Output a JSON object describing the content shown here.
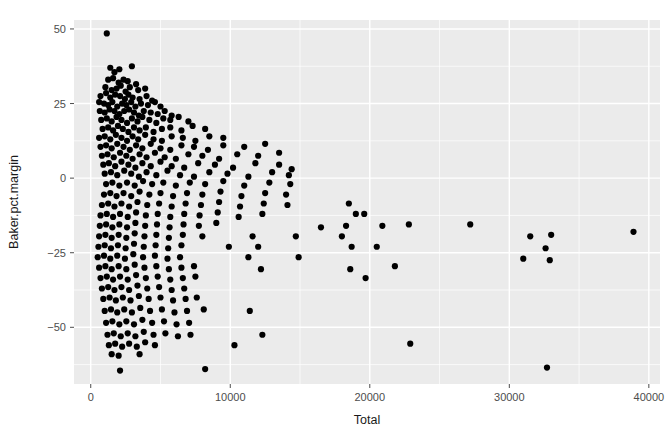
{
  "figure": {
    "kind": "scatter-plot",
    "background_color": "#FFFFFF",
    "panel_color": "#EBEBEB",
    "gridline_color": "#FFFFFF",
    "point_color": "#000000",
    "tick_label_color": "#4D4D4D",
    "axis_title_color": "#1A1A1A"
  },
  "chart_data": {
    "type": "scatter",
    "title": "",
    "xlabel": "Total",
    "ylabel": "Baker.pct.margin",
    "xlim": [
      -1200,
      40800
    ],
    "ylim": [
      -69,
      53
    ],
    "xticks": [
      0,
      10000,
      20000,
      30000,
      40000
    ],
    "xtick_labels": [
      "0",
      "10000",
      "20000",
      "30000",
      "40000"
    ],
    "yticks": [
      -50,
      -25,
      0,
      25,
      50
    ],
    "ytick_labels": [
      "-50",
      "-25",
      "0",
      "25",
      "50"
    ],
    "grid": true,
    "minor_grid": true,
    "legend": "none",
    "point_color": "#000000",
    "point_size": 3.1,
    "n_points": 306,
    "points": [
      [
        1150,
        48.5
      ],
      [
        1400,
        37.0
      ],
      [
        1700,
        35.5
      ],
      [
        2050,
        36.5
      ],
      [
        2950,
        37.5
      ],
      [
        1250,
        33.0
      ],
      [
        1600,
        33.5
      ],
      [
        2000,
        32.0
      ],
      [
        2350,
        33.0
      ],
      [
        2650,
        32.5
      ],
      [
        3250,
        31.5
      ],
      [
        1050,
        30.5
      ],
      [
        1500,
        29.5
      ],
      [
        1850,
        30.0
      ],
      [
        2150,
        31.0
      ],
      [
        2500,
        29.0
      ],
      [
        2800,
        30.5
      ],
      [
        3400,
        29.5
      ],
      [
        3900,
        30.0
      ],
      [
        700,
        27.5
      ],
      [
        1100,
        28.5
      ],
      [
        1400,
        27.0
      ],
      [
        1750,
        28.0
      ],
      [
        2100,
        27.5
      ],
      [
        2450,
        26.5
      ],
      [
        2700,
        28.0
      ],
      [
        3000,
        27.0
      ],
      [
        3500,
        26.5
      ],
      [
        4000,
        27.5
      ],
      [
        4400,
        26.0
      ],
      [
        600,
        25.5
      ],
      [
        950,
        25.0
      ],
      [
        1250,
        24.5
      ],
      [
        1550,
        25.5
      ],
      [
        1900,
        24.0
      ],
      [
        2250,
        25.0
      ],
      [
        2550,
        24.5
      ],
      [
        2900,
        25.5
      ],
      [
        3200,
        24.0
      ],
      [
        3600,
        25.0
      ],
      [
        4100,
        24.5
      ],
      [
        4600,
        25.5
      ],
      [
        5000,
        24.0
      ],
      [
        650,
        22.5
      ],
      [
        1000,
        22.0
      ],
      [
        1350,
        23.0
      ],
      [
        1700,
        22.5
      ],
      [
        2050,
        21.5
      ],
      [
        2400,
        22.5
      ],
      [
        2750,
        23.0
      ],
      [
        3100,
        22.0
      ],
      [
        3450,
        21.0
      ],
      [
        3800,
        22.5
      ],
      [
        4300,
        22.0
      ],
      [
        4800,
        21.5
      ],
      [
        5300,
        22.5
      ],
      [
        5800,
        21.0
      ],
      [
        750,
        19.5
      ],
      [
        1150,
        20.0
      ],
      [
        1500,
        19.0
      ],
      [
        1850,
        20.5
      ],
      [
        2200,
        19.5
      ],
      [
        2600,
        18.5
      ],
      [
        2950,
        20.0
      ],
      [
        3350,
        19.0
      ],
      [
        3700,
        20.5
      ],
      [
        4200,
        19.5
      ],
      [
        4700,
        18.5
      ],
      [
        5200,
        20.0
      ],
      [
        5700,
        19.5
      ],
      [
        6300,
        20.5
      ],
      [
        7000,
        19.0
      ],
      [
        850,
        16.5
      ],
      [
        1250,
        17.0
      ],
      [
        1600,
        16.0
      ],
      [
        1950,
        17.5
      ],
      [
        2300,
        16.5
      ],
      [
        2700,
        15.5
      ],
      [
        3100,
        17.0
      ],
      [
        3500,
        16.0
      ],
      [
        3950,
        17.0
      ],
      [
        4500,
        15.5
      ],
      [
        5100,
        16.5
      ],
      [
        5700,
        17.0
      ],
      [
        6500,
        16.0
      ],
      [
        7300,
        17.5
      ],
      [
        8200,
        16.5
      ],
      [
        600,
        13.5
      ],
      [
        1000,
        14.0
      ],
      [
        1400,
        13.0
      ],
      [
        1800,
        14.5
      ],
      [
        2200,
        13.5
      ],
      [
        2600,
        12.5
      ],
      [
        3000,
        14.0
      ],
      [
        3400,
        13.0
      ],
      [
        3900,
        14.5
      ],
      [
        4500,
        13.0
      ],
      [
        5100,
        12.5
      ],
      [
        5800,
        14.0
      ],
      [
        6600,
        13.5
      ],
      [
        7500,
        12.5
      ],
      [
        8500,
        14.0
      ],
      [
        9500,
        13.5
      ],
      [
        700,
        10.5
      ],
      [
        1100,
        11.0
      ],
      [
        1500,
        10.0
      ],
      [
        1900,
        11.5
      ],
      [
        2350,
        10.5
      ],
      [
        2800,
        9.5
      ],
      [
        3250,
        11.0
      ],
      [
        3700,
        10.0
      ],
      [
        4300,
        11.5
      ],
      [
        5000,
        10.0
      ],
      [
        5700,
        9.5
      ],
      [
        6500,
        11.0
      ],
      [
        7400,
        10.5
      ],
      [
        8400,
        9.5
      ],
      [
        9500,
        11.0
      ],
      [
        11000,
        10.5
      ],
      [
        12500,
        11.5
      ],
      [
        800,
        7.5
      ],
      [
        1200,
        8.0
      ],
      [
        1650,
        7.0
      ],
      [
        2100,
        8.5
      ],
      [
        2550,
        7.5
      ],
      [
        3000,
        6.5
      ],
      [
        3500,
        8.0
      ],
      [
        4000,
        7.0
      ],
      [
        4600,
        8.5
      ],
      [
        5300,
        7.0
      ],
      [
        6100,
        6.5
      ],
      [
        7000,
        8.0
      ],
      [
        8000,
        7.5
      ],
      [
        9200,
        6.5
      ],
      [
        10500,
        8.0
      ],
      [
        12000,
        7.5
      ],
      [
        13500,
        8.5
      ],
      [
        900,
        4.5
      ],
      [
        1300,
        5.0
      ],
      [
        1750,
        4.0
      ],
      [
        2200,
        5.5
      ],
      [
        2700,
        4.5
      ],
      [
        3200,
        3.5
      ],
      [
        3700,
        5.0
      ],
      [
        4300,
        4.0
      ],
      [
        5000,
        5.5
      ],
      [
        5800,
        4.0
      ],
      [
        6700,
        3.5
      ],
      [
        7700,
        5.0
      ],
      [
        8900,
        4.5
      ],
      [
        10200,
        3.5
      ],
      [
        11800,
        5.0
      ],
      [
        13500,
        4.5
      ],
      [
        14400,
        3.0
      ],
      [
        1000,
        1.5
      ],
      [
        1450,
        2.0
      ],
      [
        1900,
        1.0
      ],
      [
        2400,
        2.5
      ],
      [
        2900,
        1.5
      ],
      [
        3450,
        0.5
      ],
      [
        4000,
        2.0
      ],
      [
        4700,
        1.0
      ],
      [
        5500,
        2.5
      ],
      [
        6400,
        1.0
      ],
      [
        7400,
        0.5
      ],
      [
        8500,
        2.0
      ],
      [
        9800,
        1.5
      ],
      [
        11300,
        0.5
      ],
      [
        13000,
        2.0
      ],
      [
        14200,
        1.0
      ],
      [
        1100,
        -2.0
      ],
      [
        1550,
        -1.5
      ],
      [
        2050,
        -2.5
      ],
      [
        2600,
        -1.5
      ],
      [
        3150,
        -2.5
      ],
      [
        3750,
        -1.0
      ],
      [
        4400,
        -2.0
      ],
      [
        5200,
        -1.5
      ],
      [
        6100,
        -2.5
      ],
      [
        7100,
        -1.5
      ],
      [
        8200,
        -2.0
      ],
      [
        9500,
        -1.0
      ],
      [
        11000,
        -2.5
      ],
      [
        12800,
        -1.5
      ],
      [
        14300,
        -2.0
      ],
      [
        950,
        -5.5
      ],
      [
        1400,
        -5.0
      ],
      [
        1850,
        -6.0
      ],
      [
        2350,
        -5.0
      ],
      [
        2900,
        -6.0
      ],
      [
        3500,
        -4.5
      ],
      [
        4200,
        -5.5
      ],
      [
        5000,
        -5.0
      ],
      [
        5900,
        -6.0
      ],
      [
        6900,
        -5.0
      ],
      [
        8000,
        -5.5
      ],
      [
        9300,
        -4.5
      ],
      [
        10800,
        -6.0
      ],
      [
        12500,
        -5.0
      ],
      [
        14000,
        -5.5
      ],
      [
        800,
        -9.0
      ],
      [
        1250,
        -8.5
      ],
      [
        1700,
        -9.5
      ],
      [
        2200,
        -8.5
      ],
      [
        2750,
        -9.5
      ],
      [
        3350,
        -8.0
      ],
      [
        4050,
        -9.0
      ],
      [
        4900,
        -8.5
      ],
      [
        5800,
        -9.5
      ],
      [
        6800,
        -8.5
      ],
      [
        7900,
        -9.0
      ],
      [
        9200,
        -8.0
      ],
      [
        10700,
        -9.5
      ],
      [
        12400,
        -8.5
      ],
      [
        14100,
        -9.0
      ],
      [
        18500,
        -8.5
      ],
      [
        700,
        -12.5
      ],
      [
        1150,
        -12.0
      ],
      [
        1600,
        -13.0
      ],
      [
        2100,
        -12.0
      ],
      [
        2650,
        -13.0
      ],
      [
        3250,
        -11.5
      ],
      [
        3950,
        -12.5
      ],
      [
        4800,
        -12.0
      ],
      [
        5700,
        -13.0
      ],
      [
        6700,
        -12.0
      ],
      [
        7800,
        -12.5
      ],
      [
        9100,
        -11.5
      ],
      [
        10600,
        -13.0
      ],
      [
        12300,
        -12.0
      ],
      [
        19000,
        -12.0
      ],
      [
        19600,
        -12.0
      ],
      [
        650,
        -16.0
      ],
      [
        1100,
        -15.5
      ],
      [
        1550,
        -16.5
      ],
      [
        2050,
        -15.5
      ],
      [
        2600,
        -16.5
      ],
      [
        3200,
        -15.0
      ],
      [
        3900,
        -16.0
      ],
      [
        4750,
        -15.5
      ],
      [
        5650,
        -16.5
      ],
      [
        6650,
        -15.5
      ],
      [
        7750,
        -16.0
      ],
      [
        9000,
        -15.0
      ],
      [
        16500,
        -16.5
      ],
      [
        18300,
        -16.0
      ],
      [
        20900,
        -16.0
      ],
      [
        22800,
        -15.5
      ],
      [
        27200,
        -15.5
      ],
      [
        600,
        -19.5
      ],
      [
        1050,
        -19.0
      ],
      [
        1500,
        -20.0
      ],
      [
        2000,
        -19.0
      ],
      [
        2550,
        -20.0
      ],
      [
        3150,
        -18.5
      ],
      [
        3850,
        -19.5
      ],
      [
        4700,
        -19.0
      ],
      [
        5600,
        -20.0
      ],
      [
        6600,
        -19.0
      ],
      [
        8000,
        -19.5
      ],
      [
        11600,
        -19.5
      ],
      [
        14700,
        -19.5
      ],
      [
        18000,
        -19.5
      ],
      [
        31500,
        -19.5
      ],
      [
        33000,
        -19.0
      ],
      [
        550,
        -23.0
      ],
      [
        1000,
        -22.5
      ],
      [
        1450,
        -23.5
      ],
      [
        1950,
        -22.5
      ],
      [
        2500,
        -23.5
      ],
      [
        3100,
        -22.0
      ],
      [
        3800,
        -23.0
      ],
      [
        4650,
        -22.5
      ],
      [
        5550,
        -23.5
      ],
      [
        6500,
        -22.5
      ],
      [
        9900,
        -23.0
      ],
      [
        12000,
        -23.0
      ],
      [
        18700,
        -23.0
      ],
      [
        20500,
        -23.0
      ],
      [
        32600,
        -23.5
      ],
      [
        500,
        -26.5
      ],
      [
        950,
        -26.0
      ],
      [
        1400,
        -27.0
      ],
      [
        1900,
        -26.0
      ],
      [
        2450,
        -27.0
      ],
      [
        3050,
        -25.5
      ],
      [
        3750,
        -26.5
      ],
      [
        4600,
        -26.0
      ],
      [
        5500,
        -27.0
      ],
      [
        6400,
        -26.5
      ],
      [
        11300,
        -26.5
      ],
      [
        14900,
        -26.5
      ],
      [
        31000,
        -27.0
      ],
      [
        32900,
        -27.5
      ],
      [
        600,
        -30.0
      ],
      [
        1050,
        -29.5
      ],
      [
        1500,
        -30.5
      ],
      [
        2000,
        -29.5
      ],
      [
        2550,
        -30.5
      ],
      [
        3150,
        -29.0
      ],
      [
        3850,
        -30.0
      ],
      [
        4700,
        -29.5
      ],
      [
        5600,
        -30.5
      ],
      [
        6500,
        -30.0
      ],
      [
        7400,
        -29.5
      ],
      [
        12200,
        -30.5
      ],
      [
        18600,
        -30.5
      ],
      [
        21800,
        -29.5
      ],
      [
        700,
        -33.5
      ],
      [
        1150,
        -33.0
      ],
      [
        1600,
        -34.0
      ],
      [
        2100,
        -33.0
      ],
      [
        2650,
        -34.0
      ],
      [
        3250,
        -32.5
      ],
      [
        3950,
        -33.5
      ],
      [
        4800,
        -33.0
      ],
      [
        5700,
        -34.0
      ],
      [
        6600,
        -33.5
      ],
      [
        7500,
        -33.0
      ],
      [
        19700,
        -33.5
      ],
      [
        800,
        -37.0
      ],
      [
        1250,
        -36.5
      ],
      [
        1700,
        -37.5
      ],
      [
        2200,
        -36.5
      ],
      [
        2750,
        -37.5
      ],
      [
        3350,
        -36.0
      ],
      [
        4050,
        -37.0
      ],
      [
        4900,
        -36.5
      ],
      [
        5800,
        -37.5
      ],
      [
        6700,
        -37.0
      ],
      [
        900,
        -40.5
      ],
      [
        1350,
        -40.0
      ],
      [
        1800,
        -41.0
      ],
      [
        2300,
        -40.0
      ],
      [
        2850,
        -41.0
      ],
      [
        3450,
        -39.5
      ],
      [
        4150,
        -40.5
      ],
      [
        5000,
        -40.0
      ],
      [
        5900,
        -41.0
      ],
      [
        6800,
        -40.5
      ],
      [
        7600,
        -40.0
      ],
      [
        1000,
        -44.5
      ],
      [
        1450,
        -44.0
      ],
      [
        1900,
        -45.0
      ],
      [
        2400,
        -44.0
      ],
      [
        2950,
        -45.0
      ],
      [
        3550,
        -43.5
      ],
      [
        4250,
        -44.5
      ],
      [
        5100,
        -44.0
      ],
      [
        6000,
        -45.0
      ],
      [
        6900,
        -44.5
      ],
      [
        8100,
        -44.0
      ],
      [
        11400,
        -44.5
      ],
      [
        1100,
        -48.5
      ],
      [
        1550,
        -48.0
      ],
      [
        2050,
        -49.0
      ],
      [
        2550,
        -48.0
      ],
      [
        3100,
        -49.0
      ],
      [
        3700,
        -47.5
      ],
      [
        4400,
        -48.5
      ],
      [
        5250,
        -48.0
      ],
      [
        6150,
        -49.0
      ],
      [
        7050,
        -48.5
      ],
      [
        1200,
        -52.5
      ],
      [
        1650,
        -52.0
      ],
      [
        2150,
        -53.0
      ],
      [
        2650,
        -52.0
      ],
      [
        3200,
        -53.0
      ],
      [
        3800,
        -51.5
      ],
      [
        4500,
        -52.5
      ],
      [
        5350,
        -52.0
      ],
      [
        6250,
        -53.0
      ],
      [
        7150,
        -52.5
      ],
      [
        12300,
        -52.5
      ],
      [
        1300,
        -56.0
      ],
      [
        1750,
        -55.5
      ],
      [
        2250,
        -56.5
      ],
      [
        2750,
        -55.5
      ],
      [
        3300,
        -56.5
      ],
      [
        3900,
        -55.0
      ],
      [
        4600,
        -56.0
      ],
      [
        10300,
        -56.0
      ],
      [
        22900,
        -55.5
      ],
      [
        1500,
        -59.0
      ],
      [
        2000,
        -59.5
      ],
      [
        3500,
        -59.0
      ],
      [
        2100,
        -64.5
      ],
      [
        8200,
        -64.0
      ],
      [
        32700,
        -63.5
      ],
      [
        38900,
        -18.0
      ]
    ]
  },
  "axes": {
    "x_title": "Total",
    "y_title": "Baker.pct.margin"
  }
}
